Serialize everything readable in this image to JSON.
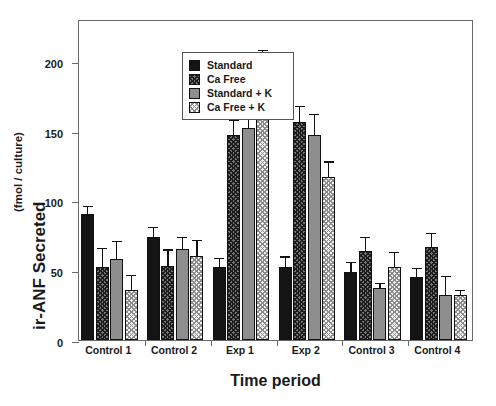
{
  "chart_data": {
    "type": "bar",
    "title": "",
    "xlabel": "Time period",
    "ylabel": "ir-ANF Secreted",
    "ylabel_unit": "(fmol / culture)",
    "ylim": [
      0,
      230
    ],
    "yticks": [
      0,
      50,
      100,
      150,
      200
    ],
    "ytick_labels": [
      "0",
      "50",
      "100",
      "150",
      "200"
    ],
    "grid": false,
    "legend_position": "top-left inside",
    "categories": [
      "Control 1",
      "Control 2",
      "Exp 1",
      "Exp 2",
      "Control 3",
      "Control 4"
    ],
    "series": [
      {
        "name": "Standard",
        "pattern": "solid-black",
        "values": [
          90,
          74,
          52,
          52,
          49,
          45
        ],
        "errors": [
          5,
          6,
          6,
          7,
          6,
          6
        ]
      },
      {
        "name": "Ca Free",
        "pattern": "cross-hatch-dark",
        "values": [
          52,
          53,
          147,
          156,
          64,
          67
        ],
        "errors": [
          13,
          11,
          10,
          11,
          9,
          9
        ]
      },
      {
        "name": "Standard + K",
        "pattern": "solid-gray",
        "values": [
          58,
          65,
          152,
          147,
          37,
          32
        ],
        "errors": [
          12,
          8,
          23,
          14,
          3,
          13
        ]
      },
      {
        "name": "Ca Free + K",
        "pattern": "stipple-light",
        "values": [
          36,
          60,
          182,
          117,
          52,
          32
        ],
        "errors": [
          10,
          11,
          25,
          10,
          10,
          3
        ]
      }
    ]
  },
  "legend": {
    "items": [
      {
        "label": "Standard"
      },
      {
        "label": "Ca Free"
      },
      {
        "label": "Standard + K"
      },
      {
        "label": "Ca Free + K"
      }
    ]
  },
  "colors": {
    "standard": "#141414",
    "ca_free": "#777777",
    "standard_k": "#8e8e8e",
    "ca_free_k": "#f2f2f2",
    "axis": "#6a6a6a",
    "text": "#1a1a1a"
  }
}
